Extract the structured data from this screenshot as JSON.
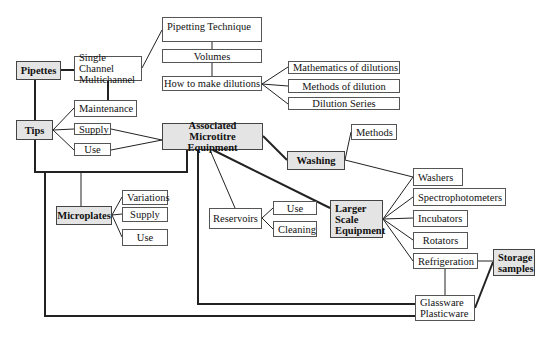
{
  "diagram": {
    "type": "concept-map",
    "nodes": {
      "pipettes": "Pipettes",
      "single_multi": "Single Channel\nMultichannel",
      "pipetting_technique": "Pipetting Technique",
      "volumes": "Volumes",
      "how_to_dilute": "How to make dilutions",
      "math_dilutions": "Mathematics of dilutions",
      "methods_dilution": "Methods of dilution",
      "dilution_series": "Dilution Series",
      "maintenance": "Maintenance",
      "tips": "Tips",
      "tips_supply": "Supply",
      "tips_use": "Use",
      "assoc_equipment": "Associated Microtitre\nEquipment",
      "washing": "Washing",
      "washing_methods": "Methods",
      "washers": "Washers",
      "spectrophotometers": "Spectrophotometers",
      "incubators": "Incubators",
      "rotators": "Rotators",
      "refrigeration": "Refrigeration",
      "storage_samples": "Storage\nsamples",
      "glass_plastic": "Glassware\nPlasticware",
      "larger_scale": "Larger\nScale\nEquipment",
      "reservoirs": "Reservoirs",
      "reservoirs_use": "Use",
      "reservoirs_cleaning": "Cleaning",
      "microplates": "Microplates",
      "mp_variations": "Variations",
      "mp_supply": "Supply",
      "mp_use": "Use"
    },
    "colors": {
      "main_fill": "#e4e4e4",
      "sub_fill": "#ffffff",
      "line": "#222222"
    }
  }
}
